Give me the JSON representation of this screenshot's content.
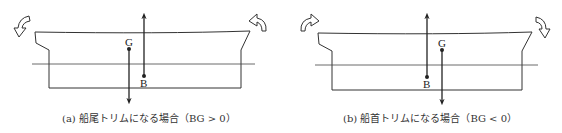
{
  "panels": [
    {
      "id": "a",
      "caption": "(a) 船尾トリムになる場合（BG > 0）",
      "labels": {
        "g": "G",
        "b": "B"
      },
      "rotation": "counterclockwise",
      "trim": "stern"
    },
    {
      "id": "b",
      "caption": "(b) 船首トリムになる場合（BG < 0）",
      "labels": {
        "g": "G",
        "b": "B"
      },
      "rotation": "clockwise",
      "trim": "bow"
    }
  ],
  "colors": {
    "line": "#333333",
    "background": "#ffffff"
  }
}
